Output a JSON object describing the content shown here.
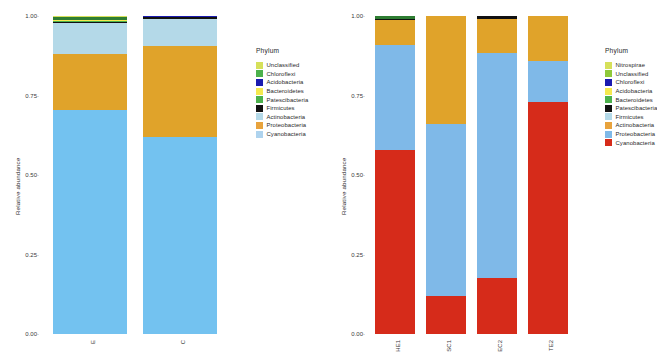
{
  "figure": {
    "panels": [
      {
        "id": "left",
        "axis": {
          "ylabel": "Relative abundance",
          "yticks": [
            "1.00",
            "0.75",
            "0.50",
            "0.25",
            "0.00"
          ],
          "ylim": [
            0,
            1
          ]
        },
        "legend": {
          "title": "Phylum",
          "items": [
            {
              "label": "Unclassified",
              "color": "#d6e05a"
            },
            {
              "label": "Chloroflexi",
              "color": "#4cb14c"
            },
            {
              "label": "Acidobacteria",
              "color": "#1b1bb0"
            },
            {
              "label": "Bacteroidetes",
              "color": "#f5e94e"
            },
            {
              "label": "Patescibacteria",
              "color": "#4cb14c"
            },
            {
              "label": "Firmicutes",
              "color": "#111111"
            },
            {
              "label": "Actinobacteria",
              "color": "#b4d9e8"
            },
            {
              "label": "Proteobacteria",
              "color": "#e8a33d"
            },
            {
              "label": "Cyanobacteria",
              "color": "#aed3ee"
            }
          ]
        },
        "chart_data": {
          "type": "bar",
          "stacked": true,
          "title": "",
          "xlabel": "",
          "ylabel": "Relative abundance",
          "ylim": [
            0,
            1
          ],
          "grid": false,
          "legend_position": "right",
          "categories": [
            "E",
            "C"
          ],
          "series": [
            {
              "name": "Cyanobacteria",
              "color": "#73c2f0",
              "values": [
                0.71,
                0.62
              ]
            },
            {
              "name": "Proteobacteria",
              "color": "#e0a32a",
              "values": [
                0.175,
                0.285
              ]
            },
            {
              "name": "Actinobacteria",
              "color": "#b4d9e8",
              "values": [
                0.1,
                0.086
              ]
            },
            {
              "name": "Firmicutes",
              "color": "#111111",
              "values": [
                0.002,
                0.006
              ]
            },
            {
              "name": "Patescibacteria",
              "color": "#4cb14c",
              "values": [
                0.002,
                0.0
              ]
            },
            {
              "name": "Bacteroidetes",
              "color": "#f5e94e",
              "values": [
                0.001,
                0.0
              ]
            },
            {
              "name": "Acidobacteria",
              "color": "#1b1bb0",
              "values": [
                0.0,
                0.003
              ]
            },
            {
              "name": "Chloroflexi",
              "color": "#2e7d32",
              "values": [
                0.009,
                0.0
              ]
            },
            {
              "name": "Unclassified",
              "color": "#d6e05a",
              "values": [
                0.001,
                0.0
              ]
            }
          ]
        }
      },
      {
        "id": "right",
        "axis": {
          "ylabel": "Relative abundance",
          "yticks": [
            "1.00",
            "0.75",
            "0.50",
            "0.25",
            "0.00"
          ],
          "ylim": [
            0,
            1
          ]
        },
        "legend": {
          "title": "Phylum",
          "items": [
            {
              "label": "Nitrospirae",
              "color": "#d6e05a"
            },
            {
              "label": "Unclassified",
              "color": "#8fc93a"
            },
            {
              "label": "Chloroflexi",
              "color": "#1b1bb0"
            },
            {
              "label": "Acidobacteria",
              "color": "#f5e94e"
            },
            {
              "label": "Bacteroidetes",
              "color": "#4cb14c"
            },
            {
              "label": "Patescibacteria",
              "color": "#111111"
            },
            {
              "label": "Firmicutes",
              "color": "#b4d9e8"
            },
            {
              "label": "Actinobacteria",
              "color": "#e8a33d"
            },
            {
              "label": "Proteobacteria",
              "color": "#7fb9e8"
            },
            {
              "label": "Cyanobacteria",
              "color": "#d62b1a"
            }
          ]
        },
        "chart_data": {
          "type": "bar",
          "stacked": true,
          "title": "",
          "xlabel": "",
          "ylabel": "Relative abundance",
          "ylim": [
            0,
            1
          ],
          "grid": false,
          "legend_position": "right",
          "categories": [
            "HE1",
            "SC1",
            "EC2",
            "TE2"
          ],
          "series": [
            {
              "name": "Cyanobacteria",
              "color": "#d62b1a",
              "values": [
                0.58,
                0.12,
                0.175,
                0.73
              ]
            },
            {
              "name": "Proteobacteria",
              "color": "#7fb9e8",
              "values": [
                0.33,
                0.54,
                0.71,
                0.13
              ]
            },
            {
              "name": "Actinobacteria",
              "color": "#e0a32a",
              "values": [
                0.078,
                0.34,
                0.105,
                0.14
              ]
            },
            {
              "name": "Firmicutes",
              "color": "#111111",
              "values": [
                0.003,
                0.0,
                0.01,
                0.0
              ]
            },
            {
              "name": "Chloroflexi",
              "color": "#2e7d32",
              "values": [
                0.009,
                0.0,
                0.0,
                0.0
              ]
            }
          ]
        }
      }
    ]
  }
}
